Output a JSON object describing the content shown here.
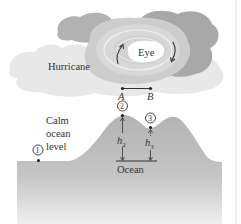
{
  "figure": {
    "labels": {
      "hurricane": "Hurricane",
      "eye": "Eye",
      "calm_line1": "Calm",
      "calm_line2": "ocean",
      "calm_line3": "level",
      "ocean": "Ocean",
      "point_a": "A",
      "point_b": "B",
      "h2_var": "h",
      "h2_sub": "2",
      "h3_var": "h",
      "h3_sub": "3",
      "marker1": "1",
      "marker2": "2",
      "marker3": "3"
    },
    "colors": {
      "cloud_light": "#e6e6e6",
      "cloud_mid": "#c9c9c9",
      "cloud_dark": "#a9a9a9",
      "eye": "#ffffff",
      "ocean_top": "#b4b4b4",
      "ocean_bottom": "#eeeeee",
      "ink": "#333333",
      "frame": "#dddddd"
    }
  }
}
